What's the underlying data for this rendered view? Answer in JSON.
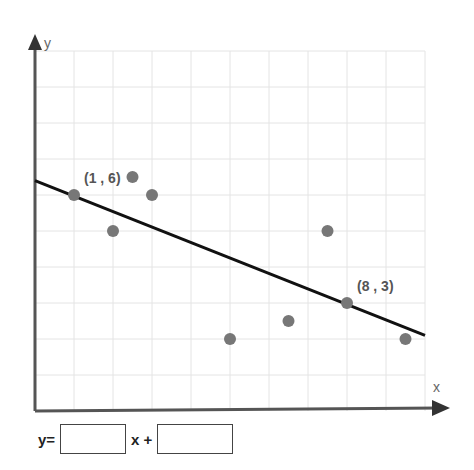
{
  "chart_data": {
    "type": "scatter",
    "title": "",
    "xlabel": "x",
    "ylabel": "y",
    "xlim": [
      0,
      10
    ],
    "ylim": [
      0,
      10
    ],
    "grid": true,
    "points": [
      {
        "x": 1,
        "y": 6
      },
      {
        "x": 2,
        "y": 5
      },
      {
        "x": 2.5,
        "y": 6.5
      },
      {
        "x": 3,
        "y": 6
      },
      {
        "x": 5,
        "y": 2
      },
      {
        "x": 6.5,
        "y": 2.5
      },
      {
        "x": 7.5,
        "y": 5
      },
      {
        "x": 8,
        "y": 3
      },
      {
        "x": 9.5,
        "y": 2
      }
    ],
    "trend_line": {
      "from": {
        "x": 0,
        "y": 6.4
      },
      "to": {
        "x": 10,
        "y": 2.1
      }
    },
    "annotations": [
      {
        "text": "(1 , 6)",
        "x": 1,
        "y": 6
      },
      {
        "text": "(8 , 3)",
        "x": 8,
        "y": 3
      }
    ]
  },
  "equation": {
    "prefix": "y=",
    "middle": "x +",
    "slope_value": "",
    "intercept_value": ""
  }
}
